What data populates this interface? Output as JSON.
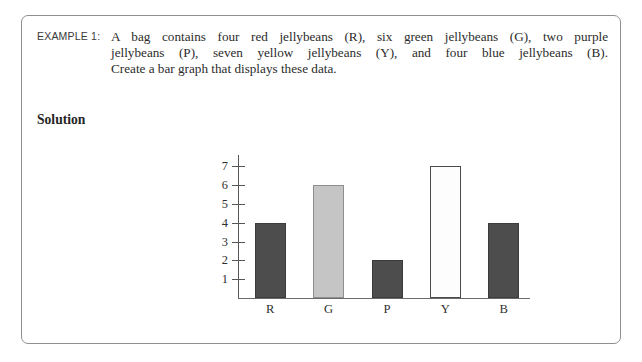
{
  "example": {
    "label": "EXAMPLE 1:",
    "body_lines": [
      "A bag contains four red jellybeans (R), six green jellybeans (G), two purple",
      "jellybeans (P), seven yellow jellybeans (Y), and four blue jellybeans (B).",
      "Create a bar graph that displays these data."
    ],
    "solution_heading": "Solution"
  },
  "chart_data": {
    "type": "bar",
    "title": "",
    "xlabel": "",
    "ylabel": "",
    "categories": [
      "R",
      "G",
      "P",
      "Y",
      "B"
    ],
    "values": [
      4,
      6,
      2,
      7,
      4
    ],
    "ylim": [
      0,
      7.6
    ],
    "y_ticks": [
      7,
      6,
      5,
      4,
      3,
      2,
      1
    ],
    "y_tick_labels": [
      "7",
      "6",
      "5",
      "4",
      "3",
      "2",
      "1"
    ],
    "grid": false,
    "legend": "none",
    "bar_styles": [
      "filled-dark",
      "filled-light",
      "filled-dark",
      "hollow",
      "filled-dark"
    ],
    "colors": {
      "dark_bar": "#4d4d4d",
      "light_bar": "#c5c5c5",
      "hollow_bar": "#fdfdfd",
      "bar_outline": "#3c3c3c",
      "axis": "#555555",
      "text": "#2f2f2f"
    }
  }
}
